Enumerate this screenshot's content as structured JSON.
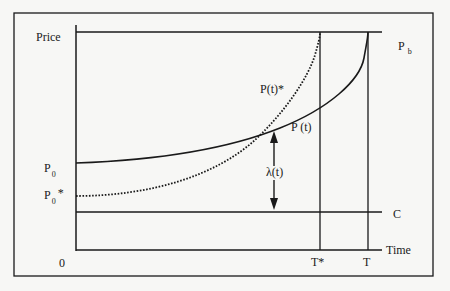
{
  "diagram": {
    "type": "economic price path diagram",
    "y_axis_label": "Price",
    "x_axis_label": "Time",
    "origin_label": "0",
    "labels": {
      "backstop_price": {
        "main": "P",
        "sub": "b"
      },
      "initial_price": {
        "main": "P",
        "sub": "0"
      },
      "initial_price_star": {
        "main": "P",
        "sub": "0",
        "suffix": "*"
      },
      "cost": "C",
      "price_path": "P (t)",
      "price_path_star": "P(t)*",
      "scarcity_rent": "λ(t)",
      "t_star": "T*",
      "t_end": "T"
    },
    "curves": [
      {
        "name": "P(t)",
        "style": "solid",
        "start": "P0",
        "end": "Pb at T"
      },
      {
        "name": "P(t)*",
        "style": "dotted",
        "start": "P0*",
        "end": "Pb at T*"
      }
    ],
    "horizontal_lines": [
      "Pb",
      "C"
    ],
    "vertical_lines": [
      "T*",
      "T"
    ],
    "annotations": [
      {
        "name": "λ(t)",
        "type": "double-arrow",
        "between": [
          "P(t)",
          "C"
        ]
      }
    ]
  },
  "colors": {
    "background": "#f7f7f5",
    "ink": "#1a1a1a"
  }
}
